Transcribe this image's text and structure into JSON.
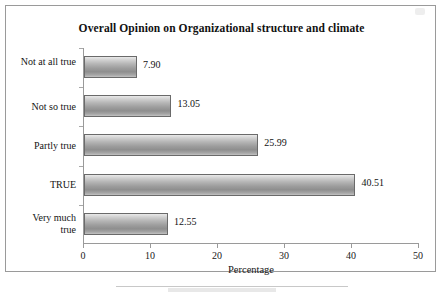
{
  "chart_data": {
    "type": "bar",
    "orientation": "horizontal",
    "title": "Overall Opinion on Organizational structure and climate",
    "xlabel": "Percentage",
    "ylabel": "",
    "xlim": [
      0,
      50
    ],
    "xticks": [
      "0",
      "10",
      "20",
      "30",
      "40",
      "50"
    ],
    "grid": false,
    "legend": null,
    "categories": [
      "Not at all true",
      "Not so true",
      "Partly true",
      "TRUE",
      "Very much true"
    ],
    "values": [
      7.9,
      13.05,
      25.99,
      40.51,
      12.55
    ],
    "value_labels": [
      "7.90",
      "13.05",
      "25.99",
      "40.51",
      "12.55"
    ],
    "bar_color": "#a8a8a8",
    "bar_border_color": "#6a6a6a",
    "axis_color": "#9a9a9a"
  }
}
